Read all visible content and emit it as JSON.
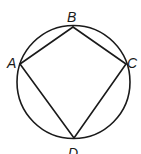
{
  "figure": {
    "shapes": {
      "circle": "circumscribed circle",
      "polygon": "quadrilateral ABCD"
    },
    "vertices": [
      {
        "id": "A",
        "label": "A"
      },
      {
        "id": "B",
        "label": "B"
      },
      {
        "id": "C",
        "label": "C"
      },
      {
        "id": "D",
        "label": "D"
      }
    ],
    "edges": [
      [
        "A",
        "B"
      ],
      [
        "B",
        "C"
      ],
      [
        "C",
        "D"
      ],
      [
        "D",
        "A"
      ]
    ]
  }
}
